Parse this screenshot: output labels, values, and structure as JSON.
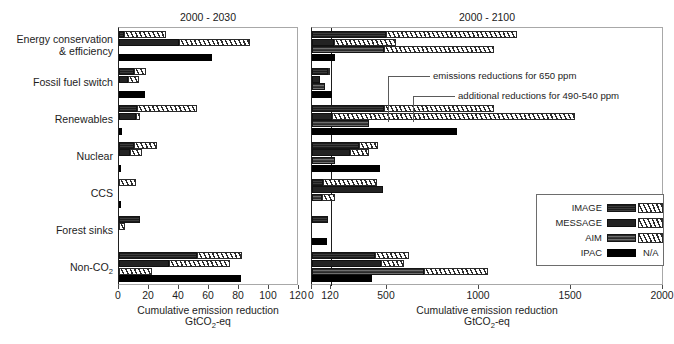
{
  "chart_data": {
    "type": "bar",
    "orientation": "horizontal",
    "title": "",
    "xlabel": "Cumulative emission reduction GtCO2-eq",
    "ylabel": "",
    "categories": [
      "Energy conservation & efficiency",
      "Fossil fuel switch",
      "Renewables",
      "Nuclear",
      "CCS",
      "Forest sinks",
      "Non-CO2"
    ],
    "models": [
      "IMAGE",
      "MESSAGE",
      "AIM",
      "IPAC"
    ],
    "stack_segments": [
      "emissions reductions for 650 ppm",
      "additional reductions for 490-540 ppm"
    ],
    "panels": [
      {
        "name": "panel-2000-2030",
        "title": "2000 - 2030",
        "xlim": [
          0,
          120
        ],
        "xticks": [
          0,
          20,
          40,
          60,
          80,
          100,
          120
        ],
        "xtick_labels": [
          "0",
          "20",
          "40",
          "60",
          "80",
          "100",
          "120"
        ],
        "grid": false,
        "series": [
          {
            "name": "IMAGE",
            "base": [
              3,
              10,
              12,
              10,
              0,
              14,
              52
            ],
            "additional": [
              28,
              8,
              40,
              15,
              11,
              0,
              30
            ]
          },
          {
            "name": "MESSAGE",
            "base": [
              40,
              6,
              11,
              7,
              0,
              0,
              33
            ],
            "additional": [
              47,
              7,
              3,
              8,
              0,
              4,
              41
            ]
          },
          {
            "name": "AIM",
            "base": [
              0,
              0,
              0,
              0,
              0,
              0,
              0
            ],
            "additional": [
              0,
              0,
              0,
              0,
              0,
              0,
              22
            ]
          },
          {
            "name": "IPAC",
            "base": [
              62,
              17,
              2,
              1,
              1,
              0,
              81
            ],
            "additional": [
              0,
              0,
              0,
              0,
              0,
              0,
              0
            ]
          }
        ]
      },
      {
        "name": "panel-2000-2100",
        "title": "2000 - 2100",
        "xlim": [
          0,
          2000
        ],
        "xticks": [
          0,
          120,
          500,
          1000,
          1500,
          2000
        ],
        "xtick_labels": [
          "0",
          "120",
          "500",
          "1000",
          "1500",
          "2000"
        ],
        "reference_line": 120,
        "grid": false,
        "series": [
          {
            "name": "IMAGE",
            "base": [
              490,
              100,
              480,
              310,
              70,
              100,
              420
            ],
            "additional": [
              715,
              10,
              600,
              130,
              360,
              0,
              200
            ]
          },
          {
            "name": "MESSAGE",
            "base": [
              140,
              50,
              130,
              250,
              470,
              0,
              460
            ],
            "additional": [
              410,
              0,
              1390,
              130,
              0,
              0,
              130
            ]
          },
          {
            "name": "AIM",
            "base": [
              480,
              80,
              380,
              145,
              60,
              0,
              700
            ],
            "additional": [
              600,
              0,
              0,
              0,
              90,
              0,
              350
            ]
          },
          {
            "name": "IPAC",
            "base": [
              150,
              130,
              880,
              450,
              0,
              95,
              400
            ],
            "additional": [
              0,
              0,
              0,
              0,
              0,
              0,
              0
            ]
          }
        ]
      }
    ],
    "annotations": [
      {
        "text": "emissions reductions for 650 ppm"
      },
      {
        "text": "additional reductions for 490-540 ppm"
      }
    ],
    "legend": {
      "position": "bottom-right of right panel",
      "entries": [
        {
          "label": "IMAGE",
          "base_swatch": "striped-dark",
          "additional_swatch": "hatched"
        },
        {
          "label": "MESSAGE",
          "base_swatch": "solid-dark",
          "additional_swatch": "hatched"
        },
        {
          "label": "AIM",
          "base_swatch": "grey-striped",
          "additional_swatch": "hatched"
        },
        {
          "label": "IPAC",
          "base_swatch": "solid-black",
          "additional_swatch": "N/A"
        }
      ],
      "na_label": "N/A"
    }
  },
  "axis": {
    "title_line1": "Cumulative emission reduction",
    "title_line2_pre": "GtCO",
    "title_line2_sub": "2",
    "title_line2_post": "-eq"
  },
  "categories_display": [
    {
      "line1": "Energy conservation",
      "line2": "& efficiency"
    },
    {
      "line1": "Fossil fuel switch",
      "line2": ""
    },
    {
      "line1": "Renewables",
      "line2": ""
    },
    {
      "line1": "Nuclear",
      "line2": ""
    },
    {
      "line1": "CCS",
      "line2": ""
    },
    {
      "line1": "Forest sinks",
      "line2": ""
    },
    {
      "line1": "Non-CO",
      "sub": "2",
      "line2": ""
    }
  ],
  "colors": {
    "ink": "#1d1d1d",
    "frame": "#a8a8a8",
    "axis": "#1d1d1d",
    "base_fill": "#232323",
    "hatch_fill": "#2b2b2b",
    "background": "#ffffff"
  }
}
